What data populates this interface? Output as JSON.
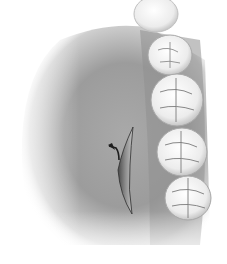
{
  "illustration": {
    "subject": "palate-incision-with-molars",
    "colors": {
      "background": "#ffffff",
      "palate_dark": "#8a8a8a",
      "palate_mid": "#b0b0b0",
      "palate_light": "#e6e6e6",
      "tooth_fill": "#f4f4f4",
      "tooth_shadow": "#bdbdbd",
      "tooth_fissure": "#7a7a7a",
      "incision_dark": "#3a3a3a",
      "incision_inner": "#9a9a9a"
    },
    "teeth": [
      {
        "cx": 156,
        "cy": 14,
        "rx": 22,
        "ry": 18
      },
      {
        "cx": 170,
        "cy": 55,
        "rx": 22,
        "ry": 20
      },
      {
        "cx": 177,
        "cy": 100,
        "rx": 26,
        "ry": 26
      },
      {
        "cx": 182,
        "cy": 152,
        "rx": 25,
        "ry": 24
      },
      {
        "cx": 188,
        "cy": 198,
        "rx": 23,
        "ry": 22
      }
    ]
  }
}
